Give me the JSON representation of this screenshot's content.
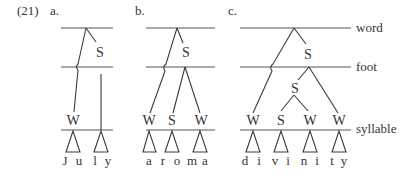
{
  "example_number": "(21)",
  "panels": [
    {
      "label": "a.",
      "word": "July",
      "feet_label_S": "S",
      "syllables": [
        {
          "label": "W",
          "segments": [
            "J",
            "u"
          ]
        },
        {
          "label": "",
          "segments": [
            "l",
            "y"
          ]
        }
      ]
    },
    {
      "label": "b.",
      "word": "aroma",
      "foot_label": "S",
      "syllables": [
        {
          "label": "W",
          "segments": [
            "a"
          ]
        },
        {
          "label": "S",
          "segments": [
            "r",
            "o"
          ]
        },
        {
          "label": "W",
          "segments": [
            "m",
            "a"
          ]
        }
      ]
    },
    {
      "label": "c.",
      "word": "divinity",
      "foot_label": "S",
      "inner_foot_label": "S",
      "syllables": [
        {
          "label": "W",
          "segments": [
            "d",
            "i"
          ]
        },
        {
          "label": "S",
          "segments": [
            "v",
            "i"
          ]
        },
        {
          "label": "W",
          "segments": [
            "n",
            "i"
          ]
        },
        {
          "label": "W",
          "segments": [
            "t",
            "y"
          ]
        }
      ]
    }
  ],
  "tiers": {
    "word": "word",
    "foot": "foot",
    "syllable": "syllable"
  }
}
